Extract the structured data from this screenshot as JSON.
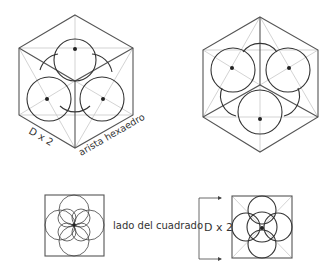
{
  "labels": {
    "left_hex_edge_label": "D x 2",
    "left_hex_side_label": "arista hexaedro",
    "square_side_label": "lado del cuadrado",
    "bracket_label": "D x 2"
  },
  "figures": [
    {
      "id": "hexagon-view-top-sphere",
      "type": "hexagon-with-4-circles",
      "center": [
        75,
        81
      ]
    },
    {
      "id": "hexagon-view-rotated",
      "type": "hexagon-with-4-circles",
      "center": [
        260,
        85
      ]
    },
    {
      "id": "square-overlapping-circles",
      "type": "square-with-5-circles",
      "center": [
        74,
        225
      ]
    },
    {
      "id": "square-four-plus-one",
      "type": "square-with-5-circles-diagonals",
      "center": [
        262,
        227
      ]
    }
  ],
  "colors": {
    "edge": "#555555",
    "guide": "#c8c8c8",
    "circle": "#333333",
    "background": "#ffffff"
  }
}
